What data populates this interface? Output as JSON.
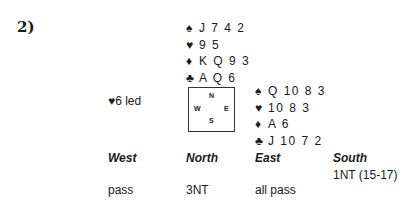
{
  "problem_number": "2)",
  "north": {
    "spades": "J 7 4 2",
    "hearts": "9 5",
    "diamonds": "K Q 9 3",
    "clubs": "A Q 6"
  },
  "east": {
    "spades": "Q 10 8 3",
    "hearts": "10 8 3",
    "diamonds": "A 6",
    "clubs": "J 10 7 2"
  },
  "suits": {
    "spades": "♠",
    "hearts": "♥",
    "diamonds": "♦",
    "clubs": "♣"
  },
  "opening_lead": "♥6 led",
  "compass": {
    "n": "N",
    "s": "S",
    "w": "W",
    "e": "E"
  },
  "auction": {
    "headers": [
      "West",
      "North",
      "East",
      "South"
    ],
    "rows": [
      [
        "",
        "",
        "",
        "1NT (15-17)"
      ],
      [
        "pass",
        "3NT",
        "all pass",
        ""
      ]
    ]
  }
}
